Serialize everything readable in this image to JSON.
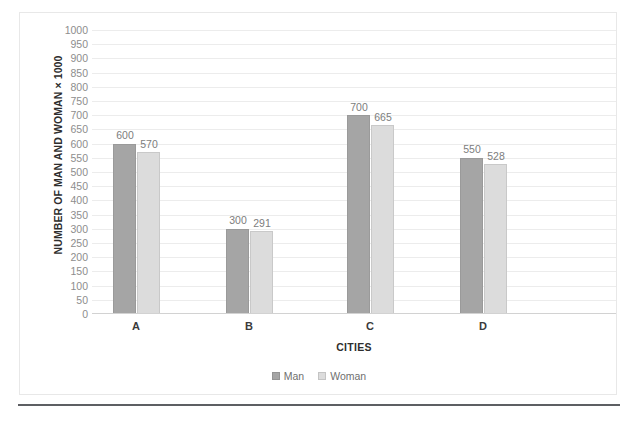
{
  "chart_data": {
    "type": "bar",
    "title": "",
    "subtitle": "",
    "xlabel": "CITIES",
    "ylabel": "NUMBER OF MAN AND WOMAN × 1000",
    "categories": [
      "A",
      "B",
      "C",
      "D"
    ],
    "series": [
      {
        "name": "Man",
        "values": [
          600,
          300,
          700,
          550
        ],
        "color": "#A5A5A5"
      },
      {
        "name": "Woman",
        "values": [
          570,
          291,
          665,
          528
        ],
        "color": "#DCDCDC"
      }
    ],
    "ylim": [
      0,
      1000
    ],
    "ytick_step": 50,
    "yticks": [
      1000,
      950,
      900,
      850,
      800,
      750,
      700,
      650,
      600,
      550,
      500,
      450,
      400,
      350,
      300,
      250,
      200,
      150,
      100,
      50,
      0
    ],
    "ytick_labels": [
      "1000",
      "950",
      "900",
      "850",
      "800",
      "750",
      "700",
      "650",
      "600",
      "550",
      "500",
      "450",
      "400",
      "350",
      "300",
      "250",
      "200",
      "150",
      "100",
      "50",
      "0"
    ],
    "data_labels": [
      {
        "category": "A",
        "man": "600",
        "woman": "570"
      },
      {
        "category": "B",
        "man": "300",
        "woman": "291"
      },
      {
        "category": "C",
        "man": "700",
        "woman": "665"
      },
      {
        "category": "D",
        "man": "550",
        "woman": "528"
      }
    ],
    "grid": true,
    "grid_axis": "y",
    "legend_position": "bottom",
    "legend": [
      "Man",
      "Woman"
    ],
    "colors": {
      "man": "#A5A5A5",
      "woman": "#DCDCDC",
      "gridline": "#ECECEC",
      "axis": "#D2D2D2",
      "tick_text": "#8D8D8D",
      "title_text": "#2E2E2E",
      "border": "#E8E8E8",
      "bottom_rule": "#5D5F63"
    }
  }
}
